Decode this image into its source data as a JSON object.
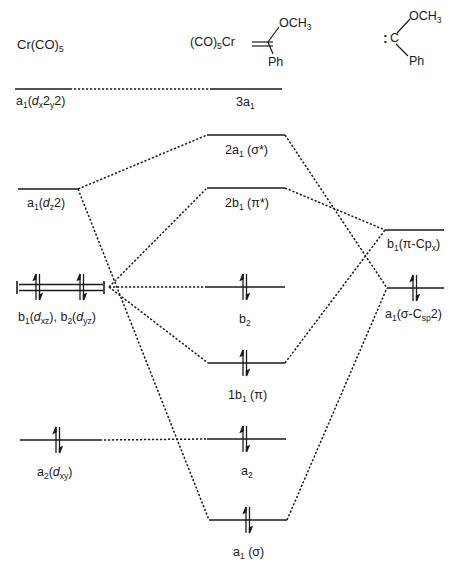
{
  "headers": {
    "left_fragment": "Cr(CO)5",
    "center_complex": {
      "metal_part": "(CO)5Cr",
      "substituent_top": "OCH3",
      "substituent_bottom": "Ph"
    },
    "right_fragment": {
      "lone_pair": ":",
      "carbon": "C",
      "substituent_top": "OCH3",
      "substituent_bottom": "Ph"
    }
  },
  "levels": {
    "left": [
      {
        "id": "a1-dx2y2",
        "label": "a1(dx2-y2)",
        "y": 89,
        "electrons": 0
      },
      {
        "id": "a1-dz2",
        "label": "a1(dz2)",
        "y": 189,
        "electrons": 0
      },
      {
        "id": "b1b2-dxz-dyz",
        "label": "b1(dxz), b2(dyz)",
        "y": 287,
        "electrons": 4,
        "degenerate": true
      },
      {
        "id": "a2-dxy",
        "label": "a2(dxy)",
        "y": 440,
        "electrons": 2
      }
    ],
    "center": [
      {
        "id": "3a1",
        "label": "3a1",
        "y": 89,
        "electrons": 0
      },
      {
        "id": "2a1-sigma-star",
        "label": "2a1 (σ*)",
        "y": 135,
        "electrons": 0
      },
      {
        "id": "2b1-pi-star",
        "label": "2b1 (π*)",
        "y": 188,
        "electrons": 0
      },
      {
        "id": "b2",
        "label": "b2",
        "y": 287,
        "electrons": 2
      },
      {
        "id": "1b1-pi",
        "label": "1b1 (π)",
        "y": 363,
        "electrons": 2
      },
      {
        "id": "a2",
        "label": "a2",
        "y": 439,
        "electrons": 2
      },
      {
        "id": "a1-sigma",
        "label": "a1 (σ)",
        "y": 520,
        "electrons": 2
      }
    ],
    "right": [
      {
        "id": "b1-pi-cpx",
        "label": "b1(π-Cpx)",
        "y": 230,
        "electrons": 0
      },
      {
        "id": "a1-sigma-csp2",
        "label": "a1(σ-Csp2)",
        "y": 288,
        "electrons": 2
      }
    ]
  },
  "correlations": [
    {
      "from": "a1-dx2y2",
      "to": "3a1"
    },
    {
      "from": "a1-dz2",
      "to": "2a1-sigma-star"
    },
    {
      "from": "a1-dz2",
      "to": "a1-sigma"
    },
    {
      "from": "b1b2-dxz-dyz",
      "to": "2b1-pi-star"
    },
    {
      "from": "b1b2-dxz-dyz",
      "to": "b2"
    },
    {
      "from": "b1b2-dxz-dyz",
      "to": "1b1-pi"
    },
    {
      "from": "a2-dxy",
      "to": "a2"
    },
    {
      "from": "b1-pi-cpx",
      "to": "2b1-pi-star"
    },
    {
      "from": "b1-pi-cpx",
      "to": "1b1-pi"
    },
    {
      "from": "a1-sigma-csp2",
      "to": "2a1-sigma-star"
    },
    {
      "from": "a1-sigma-csp2",
      "to": "a1-sigma"
    }
  ],
  "text": {
    "left_title_main": "Cr(CO)",
    "left_title_sub": "5",
    "c_metal_main": "(CO)",
    "c_metal_sub": "5",
    "c_metal_cr": "Cr",
    "c_och_main": "OCH",
    "c_och_sub": "3",
    "c_ph": "Ph",
    "r_colon": ":",
    "r_c": "C",
    "r_och_main": "OCH",
    "r_och_sub": "3",
    "r_ph": "Ph",
    "l1_a": "a",
    "l1_sub1": "1",
    "l1_open": "(",
    "l1_d": "d",
    "l1_x": "x",
    "l1_2a": "2",
    "l1_y": "y",
    "l1_2b": "2",
    "l1_close": ")",
    "l2_a": "a",
    "l2_sub1": "1",
    "l2_open": "(",
    "l2_d": "d",
    "l2_z": "z",
    "l2_2": "2",
    "l2_close": ")",
    "l3_b1": "b",
    "l3_b1sub": "1",
    "l3_open1": "(",
    "l3_d1": "d",
    "l3_xz": "xz",
    "l3_close1": "), ",
    "l3_b2": "b",
    "l3_b2sub": "2",
    "l3_open2": "(",
    "l3_d2": "d",
    "l3_yz": "yz",
    "l3_close2": ")",
    "l4_a": "a",
    "l4_sub": "2",
    "l4_open": "(",
    "l4_d": "d",
    "l4_xy": "xy",
    "l4_close": ")",
    "c1_main": "3a",
    "c1_sub": "1",
    "c2_main": "2a",
    "c2_sub": "1",
    "c2_rest": " (σ*)",
    "c3_main": "2b",
    "c3_sub": "1",
    "c3_rest": " (π*)",
    "c4_main": "b",
    "c4_sub": "2",
    "c5_main": "1b",
    "c5_sub": "1",
    "c5_rest": " (π)",
    "c6_main": "a",
    "c6_sub": "2",
    "c7_main": "a",
    "c7_sub": "1",
    "c7_rest": " (σ)",
    "r1_b": "b",
    "r1_sub": "1",
    "r1_rest": "(π-Cp",
    "r1_x": "x",
    "r1_close": ")",
    "r2_a": "a",
    "r2_sub": "1",
    "r2_rest": "(σ-C",
    "r2_sp": "sp",
    "r2_end": "2)"
  },
  "colors": {
    "line": "#1a1a1a",
    "background": "#ffffff"
  }
}
